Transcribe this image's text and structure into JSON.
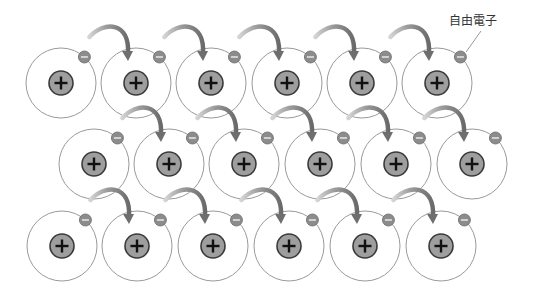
{
  "diagram": {
    "title": "",
    "label": {
      "text": "自由電子",
      "x": 449,
      "y": 25,
      "leader_from": [
        481,
        31
      ],
      "leader_to": [
        466,
        52
      ]
    },
    "atom_radius": 35,
    "nucleus_radius": 12,
    "electron_radius": 6,
    "colors": {
      "orbit": "#9a9a9a",
      "nucleus_fill": "#9e9e9e",
      "nucleus_stroke": "#3a3a3a",
      "plus": "#111111",
      "electron_fill": "#8c8c8c",
      "electron_stroke": "#6a6a6a",
      "minus": "#eeeeee",
      "arrow_start": "#cfcfcf",
      "arrow_end": "#6e6e6e",
      "label": "#333333"
    },
    "rows": [
      {
        "y": 83,
        "atoms_x": [
          61,
          136,
          211,
          287,
          362,
          437
        ]
      },
      {
        "y": 164,
        "atoms_x": [
          94,
          169,
          244,
          320,
          396,
          472
        ]
      },
      {
        "y": 246,
        "atoms_x": [
          62,
          137,
          213,
          289,
          365,
          441
        ]
      }
    ],
    "nucleus_symbol": "+",
    "electron_symbol": "−",
    "legend": [
      {
        "name": "nucleus",
        "symbol": "+"
      },
      {
        "name": "free-electron",
        "symbol": "−",
        "label": "自由電子"
      }
    ]
  }
}
